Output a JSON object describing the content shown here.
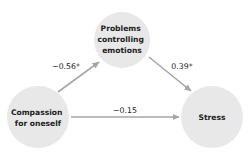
{
  "diagram": {
    "type": "mediation-path-diagram",
    "colors": {
      "node_fill": "#e8e8e8",
      "arrow": "#a6a6a6",
      "text": "#222222",
      "background": "#ffffff"
    },
    "nodes": [
      {
        "id": "mediator",
        "lines": [
          "Problems",
          "controlling",
          "emotions"
        ],
        "cx": 122,
        "cy": 40,
        "r": 28
      },
      {
        "id": "predictor",
        "lines": [
          "Compassion",
          "for oneself"
        ],
        "cx": 38,
        "cy": 117,
        "r": 31
      },
      {
        "id": "outcome",
        "lines": [
          "Stress"
        ],
        "cx": 212,
        "cy": 117,
        "r": 31
      }
    ],
    "edges": [
      {
        "from": "predictor",
        "to": "mediator",
        "label": "−0.56*"
      },
      {
        "from": "mediator",
        "to": "outcome",
        "label": "0.39*"
      },
      {
        "from": "predictor",
        "to": "outcome",
        "label": "−0.15"
      }
    ]
  }
}
